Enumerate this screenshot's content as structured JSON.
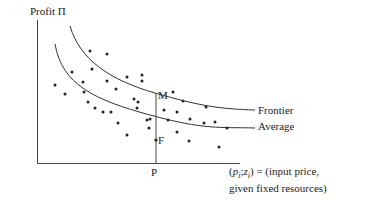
{
  "chart_data": {
    "type": "scatter",
    "title": "",
    "ylabel": "Profit Π",
    "xlabel_line1": "(p_i ; z_i) = (input price,",
    "xlabel_line2": "given fixed resources)",
    "grid": false,
    "curves": [
      {
        "name": "Frontier",
        "description": "upper convex decreasing envelope curve"
      },
      {
        "name": "Average",
        "description": "lower convex decreasing average curve"
      }
    ],
    "annotations": [
      {
        "label": "M",
        "description": "point on frontier above P"
      },
      {
        "label": "F",
        "description": "observed firm below average at P"
      },
      {
        "label": "P",
        "description": "x-axis position of vertical reference line"
      }
    ],
    "points_px": [
      [
        90,
        51
      ],
      [
        107,
        54
      ],
      [
        72,
        72
      ],
      [
        92,
        69
      ],
      [
        83,
        82
      ],
      [
        107,
        81
      ],
      [
        127,
        77
      ],
      [
        142,
        81
      ],
      [
        116,
        89
      ],
      [
        55,
        85
      ],
      [
        65,
        94
      ],
      [
        84,
        92
      ],
      [
        88,
        102
      ],
      [
        95,
        108
      ],
      [
        103,
        112
      ],
      [
        111,
        112
      ],
      [
        134,
        99
      ],
      [
        137,
        108
      ],
      [
        118,
        123
      ],
      [
        147,
        120
      ],
      [
        149,
        128
      ],
      [
        127,
        135
      ],
      [
        142,
        75
      ],
      [
        173,
        92
      ],
      [
        183,
        101
      ],
      [
        206,
        107
      ],
      [
        138,
        102
      ],
      [
        164,
        110
      ],
      [
        177,
        112
      ],
      [
        150,
        119
      ],
      [
        168,
        120
      ],
      [
        190,
        119
      ],
      [
        204,
        123
      ],
      [
        227,
        128
      ],
      [
        177,
        132
      ],
      [
        215,
        122
      ],
      [
        189,
        141
      ],
      [
        219,
        147
      ]
    ]
  },
  "labels": {
    "y_axis": "Profit Π",
    "frontier": "Frontier",
    "average": "Average",
    "point_m": "M",
    "point_f": "F",
    "point_p": "P",
    "x_axis_line1_rest": ") = (input price,",
    "x_axis_line2": "given fixed resources)"
  }
}
